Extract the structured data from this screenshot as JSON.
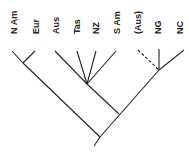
{
  "diagram": {
    "type": "cladogram",
    "taxa": [
      {
        "id": "n_am",
        "label": "N Am",
        "x": 14
      },
      {
        "id": "eur",
        "label": "Eur",
        "x": 36
      },
      {
        "id": "aus",
        "label": "Aus",
        "x": 56
      },
      {
        "id": "tas",
        "label": "Tas",
        "x": 77
      },
      {
        "id": "nz",
        "label": "NZ",
        "x": 96
      },
      {
        "id": "s_am",
        "label": "S Am",
        "x": 117
      },
      {
        "id": "aus_paren",
        "label": "(Aus)",
        "x": 138
      },
      {
        "id": "ng",
        "label": "NG",
        "x": 158
      },
      {
        "id": "nc",
        "label": "NC",
        "x": 180
      }
    ],
    "branches": [
      {
        "from": [
          12,
          51
        ],
        "to": [
          23,
          63
        ],
        "style": "solid",
        "name": "branch-n-am"
      },
      {
        "from": [
          35,
          51
        ],
        "to": [
          23,
          63
        ],
        "style": "solid",
        "name": "branch-eur"
      },
      {
        "from": [
          23,
          63
        ],
        "to": [
          100,
          137
        ],
        "style": "solid",
        "name": "branch-holarctic"
      },
      {
        "from": [
          55,
          51
        ],
        "to": [
          87,
          84
        ],
        "style": "solid",
        "name": "branch-aus"
      },
      {
        "from": [
          77,
          51
        ],
        "to": [
          87,
          84
        ],
        "style": "solid",
        "name": "branch-tas"
      },
      {
        "from": [
          96,
          51
        ],
        "to": [
          87,
          84
        ],
        "style": "solid",
        "name": "branch-nz"
      },
      {
        "from": [
          116,
          51
        ],
        "to": [
          87,
          84
        ],
        "style": "solid",
        "name": "branch-s-am"
      },
      {
        "from": [
          87,
          84
        ],
        "to": [
          119,
          114
        ],
        "style": "solid",
        "name": "branch-gondwana-clade"
      },
      {
        "from": [
          138,
          50
        ],
        "to": [
          159,
          70
        ],
        "style": "dashed",
        "name": "branch-aus-paren"
      },
      {
        "from": [
          159,
          49
        ],
        "to": [
          159,
          70
        ],
        "style": "solid",
        "name": "branch-ng"
      },
      {
        "from": [
          184,
          50
        ],
        "to": [
          159,
          70
        ],
        "style": "solid",
        "name": "branch-nc"
      },
      {
        "from": [
          159,
          70
        ],
        "to": [
          100,
          137
        ],
        "style": "solid",
        "name": "branch-main-right"
      },
      {
        "from": [
          100,
          137
        ],
        "to": [
          94,
          146
        ],
        "style": "solid",
        "name": "root-stem"
      }
    ],
    "line_color": "#222222"
  }
}
